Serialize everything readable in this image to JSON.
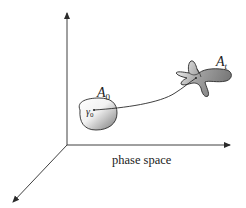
{
  "figure": {
    "axis_label": "phase space",
    "initial_region": {
      "label": "A",
      "subscript": "0"
    },
    "evolved_region": {
      "label": "A",
      "subscript": "t"
    },
    "initial_point": {
      "label": "γ",
      "subscript": "0"
    }
  },
  "colors": {
    "line": "#2a2a2a",
    "shade_dark": "#8a8a8a",
    "shade_light": "#ffffff"
  }
}
